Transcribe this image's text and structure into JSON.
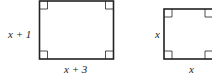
{
  "figure": {
    "rect1": {
      "height_label": "x + 1",
      "width_label": "x + 3"
    },
    "rect2": {
      "height_label": "x",
      "width_label": "x"
    }
  }
}
